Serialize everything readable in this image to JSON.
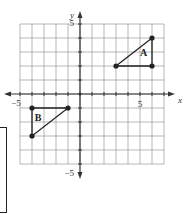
{
  "chart_data": {
    "type": "scatter",
    "title": "",
    "xlabel": "x",
    "ylabel": "y",
    "xlim": [
      -5,
      7
    ],
    "ylim": [
      -5,
      5
    ],
    "grid": true,
    "tick_labels": {
      "x": [
        {
          "value": -5,
          "label": "−5"
        },
        {
          "value": 5,
          "label": "5"
        }
      ],
      "y": [
        {
          "value": 5,
          "label": "5"
        },
        {
          "value": -5,
          "label": "−5"
        }
      ]
    },
    "series": [
      {
        "name": "A",
        "label_pos": [
          5.3,
          2.7
        ],
        "points": [
          [
            3,
            2
          ],
          [
            6,
            4
          ],
          [
            6,
            2
          ]
        ],
        "closed": true
      },
      {
        "name": "B",
        "label_pos": [
          -3.5,
          -1.9
        ],
        "points": [
          [
            -4,
            -1
          ],
          [
            -1,
            -1
          ],
          [
            -4,
            -3
          ]
        ],
        "closed": true
      }
    ],
    "colors": {
      "grid": "#9a9a9a",
      "axis": "#333333",
      "shape": "#222222",
      "point": "#222222"
    }
  }
}
